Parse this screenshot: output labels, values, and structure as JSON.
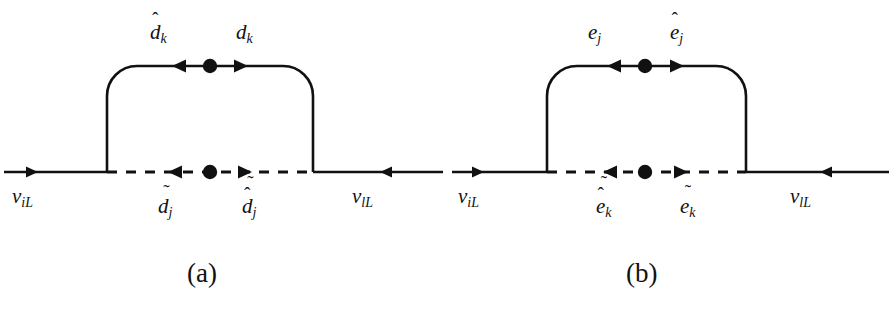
{
  "figure": {
    "type": "feynman-diagrams",
    "top_cut_text": "— — —— — ————— — — ——",
    "line_color": "#111111",
    "background_color": "#ffffff"
  },
  "diagrams": [
    {
      "id": "a",
      "caption": "(a)",
      "external_left": {
        "label_base": "ν",
        "label_sub": "iL",
        "arrow": "right"
      },
      "external_right": {
        "label_base": "ν",
        "label_sub": "lL",
        "arrow": "left"
      },
      "loop_top_left": {
        "base": "d",
        "sub": "k",
        "accent": "hat",
        "accent_glyph": "^",
        "arrow": "left"
      },
      "loop_top_right": {
        "base": "d",
        "sub": "k",
        "accent": "none",
        "accent_glyph": "",
        "arrow": "right"
      },
      "loop_bottom_left": {
        "base": "d",
        "sub": "j",
        "accent": "tilde",
        "accent_glyph": "~",
        "arrow": "left"
      },
      "loop_bottom_right": {
        "base": "d",
        "sub": "j",
        "accent": "tilde-hat",
        "accent_glyph": "~^",
        "arrow": "right"
      },
      "vertices": [
        {
          "name": "mass-insertion-top",
          "style": "filled-dot"
        },
        {
          "name": "mass-insertion-bottom",
          "style": "filled-dot"
        }
      ],
      "top_line_style": "solid",
      "bottom_line_style": "dashed"
    },
    {
      "id": "b",
      "caption": "(b)",
      "external_left": {
        "label_base": "ν",
        "label_sub": "iL",
        "arrow": "right"
      },
      "external_right": {
        "label_base": "ν",
        "label_sub": "lL",
        "arrow": "left"
      },
      "loop_top_left": {
        "base": "e",
        "sub": "j",
        "accent": "none",
        "accent_glyph": "",
        "arrow": "left"
      },
      "loop_top_right": {
        "base": "e",
        "sub": "j",
        "accent": "hat",
        "accent_glyph": "^",
        "arrow": "right"
      },
      "loop_bottom_left": {
        "base": "e",
        "sub": "k",
        "accent": "tilde-hat",
        "accent_glyph": "~^",
        "arrow": "left"
      },
      "loop_bottom_right": {
        "base": "e",
        "sub": "k",
        "accent": "tilde",
        "accent_glyph": "~",
        "arrow": "right"
      },
      "vertices": [
        {
          "name": "mass-insertion-top",
          "style": "filled-dot"
        },
        {
          "name": "mass-insertion-bottom",
          "style": "filled-dot"
        }
      ],
      "top_line_style": "solid",
      "bottom_line_style": "dashed"
    }
  ]
}
